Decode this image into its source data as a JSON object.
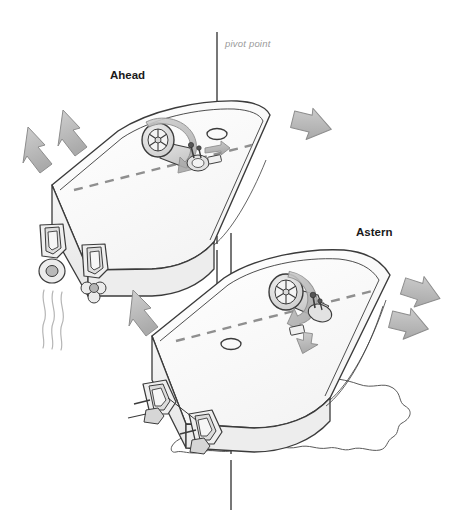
{
  "figure": {
    "background_color": "#ffffff",
    "line_color": "#3b3b3b",
    "hull_fill": "#fbfbfb",
    "hull_shade": "#efefef",
    "arrow_fill": "#b6b6b6",
    "arrow_stroke": "#7d7d7d",
    "dash_color": "#8f8f8f",
    "axis_color": "#4a4a4a",
    "pivot_label_color": "#9a9a9a"
  },
  "labels": {
    "ahead": "Ahead",
    "astern": "Astern",
    "pivot_point": "pivot point"
  },
  "diagram_elements": {
    "upper_boat": {
      "name": "Ahead",
      "description": "boat running ahead, bow to upper right",
      "pivot_marker": "ellipse on centerline forward of helm",
      "helm_rotation": "clockwise",
      "thrust_arrows": 3,
      "drive_arrows": 1
    },
    "lower_boat": {
      "name": "Astern",
      "description": "boat running astern, bow to right",
      "pivot_marker": "ellipse on centerline aft of helm",
      "helm_rotation": "counterclockwise",
      "thrust_arrows": 2,
      "drive_arrows": 1
    },
    "axes": {
      "upper_axis": "vertical pivot axis through upper boat",
      "lower_axis": "vertical pivot axis through lower boat"
    },
    "water": {
      "wake_lines": "wavy lines trailing from upper boat outboards",
      "prop_wash": "irregular outline of disturbed water near lower boat stern"
    }
  }
}
